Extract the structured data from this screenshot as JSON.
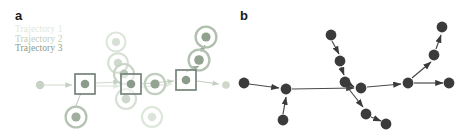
{
  "figure": {
    "background": "#ffffff",
    "panels": [
      {
        "id": "a",
        "label": "a"
      },
      {
        "id": "b",
        "label": "b"
      }
    ]
  },
  "panel_a": {
    "label": "a",
    "legend": {
      "entries": [
        {
          "label": "Trajectory 1",
          "color": "#dfe8dc"
        },
        {
          "label": "Trajectory 2",
          "color": "#c3cfc0"
        },
        {
          "label": "Trajectory 3",
          "color": "#8c9a8a"
        }
      ]
    },
    "colors": {
      "trajectory_1": "#dfe8dc",
      "trajectory_2": "#c3cfc0",
      "trajectory_3": "#8c9a8a",
      "ring_light": "#dde6da",
      "ring_mid": "#c6d2c3",
      "ring_dark": "#9aa798",
      "node_fill_light": "#e3eae1",
      "node_fill_mid": "#bcc8b9",
      "node_fill_dark": "#8f9d8d",
      "square_stroke": "#76847a",
      "edge": "#c9d2c6"
    },
    "nodes": [
      {
        "name": "start-node",
        "cx": 40,
        "cy": 85,
        "r": 4.2,
        "fill": "#c6d2c3",
        "ring": 0
      },
      {
        "name": "ringed-node-upper-mid",
        "cx": 116,
        "cy": 42,
        "r": 4.0,
        "fill": "#d7e0d4",
        "ring": 9.5
      },
      {
        "name": "ringed-node-mid-upper2",
        "cx": 118,
        "cy": 63,
        "r": 4.2,
        "fill": "#cfdacc",
        "ring": 9.8
      },
      {
        "name": "ringed-node-mid-center",
        "cx": 124,
        "cy": 74,
        "r": 4.4,
        "fill": "#b9c6b6",
        "ring": 10.0
      },
      {
        "name": "ringed-node-mid-right",
        "cx": 155,
        "cy": 84,
        "r": 4.6,
        "fill": "#94a392",
        "ring": 10.2
      },
      {
        "name": "ringed-node-mid-low",
        "cx": 126,
        "cy": 99,
        "r": 4.4,
        "fill": "#cdd8ca",
        "ring": 10.0
      },
      {
        "name": "ringed-node-bottom-left",
        "cx": 76,
        "cy": 117,
        "r": 4.6,
        "fill": "#9fae9d",
        "ring": 10.4
      },
      {
        "name": "ringed-node-bottom-right",
        "cx": 152,
        "cy": 117,
        "r": 4.2,
        "fill": "#dbe4d8",
        "ring": 10.0
      },
      {
        "name": "ringed-node-top-right",
        "cx": 206,
        "cy": 37,
        "r": 4.6,
        "fill": "#8fa08d",
        "ring": 10.4
      },
      {
        "name": "ringed-node-upper-right",
        "cx": 199,
        "cy": 60,
        "r": 4.8,
        "fill": "#93a291",
        "ring": 10.4
      },
      {
        "name": "end-node",
        "cx": 226,
        "cy": 85,
        "r": 3.8,
        "fill": "#cdd8ca",
        "ring": 0
      }
    ],
    "square_markers": [
      {
        "name": "square-marker-left",
        "cx": 85,
        "cy": 84,
        "size": 20
      },
      {
        "name": "square-marker-center",
        "cx": 131,
        "cy": 84,
        "size": 20
      },
      {
        "name": "square-marker-right",
        "cx": 186,
        "cy": 80,
        "size": 20
      }
    ]
  },
  "panel_b": {
    "label": "b",
    "colors": {
      "node": "#3b3b3b",
      "edge": "#4a4a4a"
    },
    "node_radius": 5.4,
    "nodes": [
      {
        "name": "node-far-left",
        "cx": 9,
        "cy": 83
      },
      {
        "name": "node-hub-left",
        "cx": 51,
        "cy": 89
      },
      {
        "name": "node-below-hub",
        "cx": 48,
        "cy": 120
      },
      {
        "name": "node-top-branch",
        "cx": 96,
        "cy": 35
      },
      {
        "name": "node-branch-mid",
        "cx": 105,
        "cy": 61
      },
      {
        "name": "node-branch-low",
        "cx": 110,
        "cy": 82
      },
      {
        "name": "node-center",
        "cx": 126,
        "cy": 88
      },
      {
        "name": "node-lower-branch",
        "cx": 131,
        "cy": 114
      },
      {
        "name": "node-lower-end",
        "cx": 151,
        "cy": 124
      },
      {
        "name": "node-right-hub",
        "cx": 173,
        "cy": 83
      },
      {
        "name": "node-far-right",
        "cx": 214,
        "cy": 83
      },
      {
        "name": "node-upper-right",
        "cx": 199,
        "cy": 55
      },
      {
        "name": "node-top-right",
        "cx": 207,
        "cy": 27
      }
    ],
    "edges": [
      {
        "name": "edge-farleft-to-hub",
        "from": "node-far-left",
        "to": "node-hub-left"
      },
      {
        "name": "edge-below-to-hub",
        "from": "node-below-hub",
        "to": "node-hub-left"
      },
      {
        "name": "edge-hub-to-center",
        "from": "node-hub-left",
        "to": "node-center"
      },
      {
        "name": "edge-top-to-branchmid",
        "from": "node-top-branch",
        "to": "node-branch-mid"
      },
      {
        "name": "edge-branchmid-to-branchlow",
        "from": "node-branch-mid",
        "to": "node-branch-low"
      },
      {
        "name": "edge-branchlow-to-center",
        "from": "node-branch-low",
        "to": "node-center"
      },
      {
        "name": "edge-branchlow-to-lowerbranch",
        "from": "node-branch-low",
        "to": "node-lower-branch"
      },
      {
        "name": "edge-lowerbranch-to-lowerend",
        "from": "node-lower-branch",
        "to": "node-lower-end"
      },
      {
        "name": "edge-center-to-righthub",
        "from": "node-center",
        "to": "node-right-hub"
      },
      {
        "name": "edge-righthub-to-farright",
        "from": "node-right-hub",
        "to": "node-far-right"
      },
      {
        "name": "edge-righthub-to-upperright",
        "from": "node-right-hub",
        "to": "node-upper-right"
      },
      {
        "name": "edge-upperright-to-topright",
        "from": "node-upper-right",
        "to": "node-top-right"
      }
    ]
  }
}
